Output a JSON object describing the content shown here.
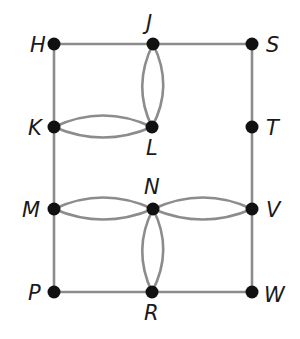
{
  "diagram": {
    "type": "graph",
    "colors": {
      "edge": "#8c8c8c",
      "node": "#111111",
      "label": "#1a1a1a"
    },
    "nodes": [
      {
        "id": "H",
        "label": "H",
        "x": 54,
        "y": 44,
        "lx": 30,
        "ly": 52
      },
      {
        "id": "J",
        "label": "J",
        "x": 153,
        "y": 44,
        "lx": 146,
        "ly": 30
      },
      {
        "id": "S",
        "label": "S",
        "x": 252,
        "y": 44,
        "lx": 266,
        "ly": 52
      },
      {
        "id": "K",
        "label": "K",
        "x": 54,
        "y": 127,
        "lx": 28,
        "ly": 135
      },
      {
        "id": "L",
        "label": "L",
        "x": 152,
        "y": 127,
        "lx": 146,
        "ly": 155
      },
      {
        "id": "T",
        "label": "T",
        "x": 252,
        "y": 127,
        "lx": 266,
        "ly": 135
      },
      {
        "id": "M",
        "label": "M",
        "x": 54,
        "y": 209,
        "lx": 22,
        "ly": 217
      },
      {
        "id": "N",
        "label": "N",
        "x": 153,
        "y": 209,
        "lx": 144,
        "ly": 194
      },
      {
        "id": "V",
        "label": "V",
        "x": 252,
        "y": 209,
        "lx": 266,
        "ly": 217
      },
      {
        "id": "P",
        "label": "P",
        "x": 54,
        "y": 292,
        "lx": 28,
        "ly": 300
      },
      {
        "id": "R",
        "label": "R",
        "x": 152,
        "y": 292,
        "lx": 144,
        "ly": 320
      },
      {
        "id": "W",
        "label": "W",
        "x": 252,
        "y": 292,
        "lx": 264,
        "ly": 302
      }
    ],
    "edges": [
      {
        "from": "H",
        "to": "J",
        "d": "M54,44 L153,44"
      },
      {
        "from": "J",
        "to": "S",
        "d": "M153,44 L252,44"
      },
      {
        "from": "H",
        "to": "K",
        "d": "M54,44 L54,127"
      },
      {
        "from": "K",
        "to": "M",
        "d": "M54,127 L54,209"
      },
      {
        "from": "M",
        "to": "P",
        "d": "M54,209 L54,292"
      },
      {
        "from": "S",
        "to": "T",
        "d": "M252,44 L252,127"
      },
      {
        "from": "T",
        "to": "V",
        "d": "M252,127 L252,209"
      },
      {
        "from": "V",
        "to": "W",
        "d": "M252,209 L252,292"
      },
      {
        "from": "P",
        "to": "R",
        "d": "M54,292 L152,292"
      },
      {
        "from": "R",
        "to": "W",
        "d": "M152,292 L252,292"
      },
      {
        "from": "J",
        "to": "L",
        "d": "M153,44 Q132,86 152,127"
      },
      {
        "from": "J",
        "to": "L",
        "d": "M153,44 Q174,86 152,127"
      },
      {
        "from": "K",
        "to": "L",
        "d": "M54,127 Q103,104 152,127"
      },
      {
        "from": "K",
        "to": "L",
        "d": "M54,127 Q103,148 152,127"
      },
      {
        "from": "M",
        "to": "N",
        "d": "M54,209 Q103,186 153,209"
      },
      {
        "from": "M",
        "to": "N",
        "d": "M54,209 Q103,230 153,209"
      },
      {
        "from": "N",
        "to": "V",
        "d": "M153,209 Q203,186 252,209"
      },
      {
        "from": "N",
        "to": "V",
        "d": "M153,209 Q203,230 252,209"
      },
      {
        "from": "N",
        "to": "R",
        "d": "M153,209 Q132,250 152,292"
      },
      {
        "from": "N",
        "to": "R",
        "d": "M153,209 Q174,250 152,292"
      }
    ]
  }
}
